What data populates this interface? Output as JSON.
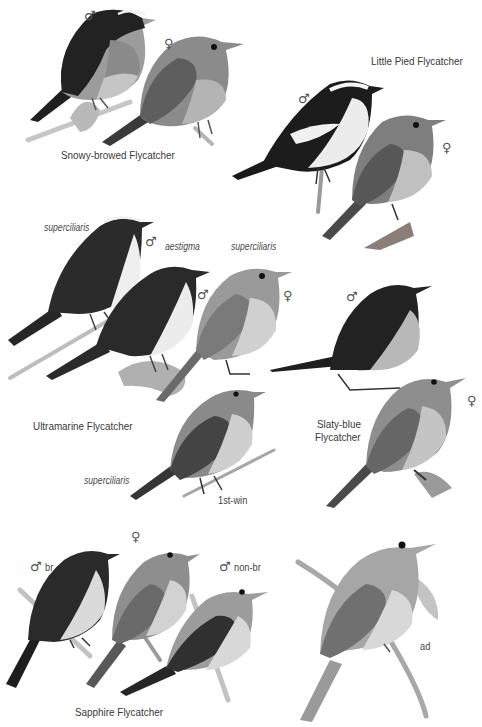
{
  "plate": {
    "background": "#ffffff",
    "species": [
      {
        "name": "Snowy-browed Flycatcher",
        "figures": [
          {
            "sex_symbol": "♂",
            "label": ""
          },
          {
            "sex_symbol": "♀",
            "label": ""
          }
        ]
      },
      {
        "name": "Little Pied Flycatcher",
        "figures": [
          {
            "sex_symbol": "♂",
            "label": ""
          },
          {
            "sex_symbol": "♀",
            "label": ""
          }
        ]
      },
      {
        "name": "Ultramarine Flycatcher",
        "figures": [
          {
            "sex_symbol": "♂",
            "label": "superciliaris"
          },
          {
            "sex_symbol": "♂",
            "label": "aestigma"
          },
          {
            "sex_symbol": "♀",
            "label": "superciliaris"
          },
          {
            "sex_symbol": "",
            "label": "superciliaris",
            "age": "1st-win"
          }
        ]
      },
      {
        "name": "Slaty-blue Flycatcher",
        "name_lines": [
          "Slaty-blue",
          "Flycatcher"
        ],
        "figures": [
          {
            "sex_symbol": "♂",
            "label": ""
          },
          {
            "sex_symbol": "♀",
            "label": ""
          }
        ]
      },
      {
        "name": "Sapphire Flycatcher",
        "figures": [
          {
            "sex_symbol": "♂",
            "label": "br"
          },
          {
            "sex_symbol": "♀",
            "label": ""
          },
          {
            "sex_symbol": "♂",
            "label": "non-br"
          }
        ]
      },
      {
        "name": "",
        "figures": [
          {
            "sex_symbol": "",
            "label": "ad"
          }
        ]
      }
    ]
  },
  "labels": {
    "snowy_name": "Snowy-browed Flycatcher",
    "snowy_male": "♂",
    "snowy_female": "♀",
    "pied_name": "Little Pied Flycatcher",
    "pied_male": "♂",
    "pied_female": "♀",
    "ultra_ssp1": "superciliaris",
    "ultra_male1": "♂",
    "ultra_ssp2": "aestigma",
    "ultra_male2": "♂",
    "ultra_ssp3": "superciliaris",
    "ultra_female": "♀",
    "ultra_name": "Ultramarine Flycatcher",
    "ultra_ssp4": "superciliaris",
    "ultra_age": "1st-win",
    "slaty_male": "♂",
    "slaty_female": "♀",
    "slaty_name_1": "Slaty-blue",
    "slaty_name_2": "Flycatcher",
    "sapphire_male_br": "♂",
    "sapphire_br": "br",
    "sapphire_female": "♀",
    "sapphire_male_nonbr": "♂",
    "sapphire_nonbr": "non-br",
    "sapphire_name": "Sapphire Flycatcher",
    "ad_label": "ad"
  },
  "tones": {
    "black": "#1c1c1c",
    "dark": "#3d3d3d",
    "mid": "#7a7a7a",
    "light": "#a9a9a9",
    "pale": "#d6d6d6",
    "white": "#f4f4f4",
    "branch": "#b8b8b8"
  }
}
